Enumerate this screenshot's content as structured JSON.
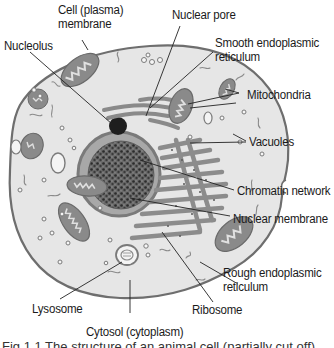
{
  "diagram": {
    "colors": {
      "cytoplasm": "#e6e6e6",
      "membrane": "#6e6e6e",
      "organelle": "#8c8c8c",
      "nucleus_fill": "#bdbdbd",
      "chromatin": "#3a3a3a",
      "nucleolus": "#1e1e1e",
      "leader_line": "#222222",
      "text": "#1a1a1a"
    },
    "labels": [
      {
        "id": "cell-membrane",
        "text_lines": [
          "Cell (plasma)",
          "membrane"
        ]
      },
      {
        "id": "nuclear-pore",
        "text_lines": [
          "Nuclear pore"
        ]
      },
      {
        "id": "nucleolus",
        "text_lines": [
          "Nucleolus"
        ]
      },
      {
        "id": "smooth-er",
        "text_lines": [
          "Smooth endoplasmic",
          "reticulum"
        ]
      },
      {
        "id": "mitochondria",
        "text_lines": [
          "Mitochondria"
        ]
      },
      {
        "id": "vacuoles",
        "text_lines": [
          "Vacuoles"
        ]
      },
      {
        "id": "chromatin-network",
        "text_lines": [
          "Chromatin network"
        ]
      },
      {
        "id": "nuclear-membrane",
        "text_lines": [
          "Nuclear membrane"
        ]
      },
      {
        "id": "rough-er",
        "text_lines": [
          "Rough endoplasmic",
          "reticulum"
        ]
      },
      {
        "id": "lysosome",
        "text_lines": [
          "Lysosome"
        ]
      },
      {
        "id": "ribosome",
        "text_lines": [
          "Ribosome"
        ]
      },
      {
        "id": "cytosol",
        "text_lines": [
          "Cytosol (cytoplasm)"
        ]
      }
    ],
    "caption": "Fig 1.1 The structure of an animal cell (partially cut off)"
  }
}
